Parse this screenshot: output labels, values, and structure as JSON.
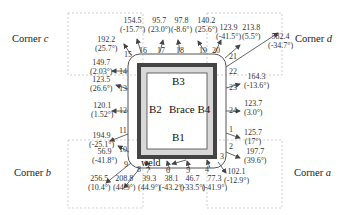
{
  "corners": {
    "a": {
      "prefix": "Corner ",
      "letter": "a"
    },
    "b": {
      "prefix": "Corner ",
      "letter": "b"
    },
    "c": {
      "prefix": "Corner ",
      "letter": "c"
    },
    "d": {
      "prefix": "Corner ",
      "letter": "d"
    }
  },
  "plates": {
    "b1": "B1",
    "b2": "B2",
    "b3": "B3",
    "brace": "Brace B4"
  },
  "weld_label": "weld",
  "points": [
    {
      "id": "1",
      "value": "125.7",
      "angle": "(17°)"
    },
    {
      "id": "2",
      "value": "197.7",
      "angle": "(39.6°)"
    },
    {
      "id": "3",
      "value": "102.1",
      "angle": "(-12.9°)"
    },
    {
      "id": "4",
      "value": "77.3",
      "angle": "(-41.9°)"
    },
    {
      "id": "5",
      "value": "46.7",
      "angle": "(-33.5°)"
    },
    {
      "id": "6",
      "value": "38.1",
      "angle": "(-43.2°)"
    },
    {
      "id": "7",
      "value": "39.3",
      "angle": "(44.9°)"
    },
    {
      "id": "8",
      "value": "208.8",
      "angle": "(44.9°)"
    },
    {
      "id": "9",
      "value": "256.5",
      "angle": "(10.4°)"
    },
    {
      "id": "10",
      "value": "56.9",
      "angle": "(-41.8°)"
    },
    {
      "id": "11",
      "value": "194.9",
      "angle": "(-25.1°)"
    },
    {
      "id": "12",
      "value": "120.1",
      "angle": "(1.52°)"
    },
    {
      "id": "13",
      "value": "123.5",
      "angle": "(26.6°)"
    },
    {
      "id": "14",
      "value": "149.7",
      "angle": "(2.03°)"
    },
    {
      "id": "15",
      "value": "192.2",
      "angle": "(25.7°)"
    },
    {
      "id": "16",
      "value": "154.5",
      "angle": "(-15.7°)"
    },
    {
      "id": "17",
      "value": "95.7",
      "angle": "(23.0°)"
    },
    {
      "id": "18",
      "value": "97.8",
      "angle": "(-8.6°)"
    },
    {
      "id": "19",
      "value": "140.2",
      "angle": "(25.6°)"
    },
    {
      "id": "20",
      "value": "123.9",
      "angle": "(-41.5°)"
    },
    {
      "id": "21",
      "value": "213.8",
      "angle": "(5.5°)"
    },
    {
      "id": "22",
      "value": "582.4",
      "angle": "(-34.7°)"
    },
    {
      "id": "23",
      "value": "164.3",
      "angle": "(-13.6°)"
    },
    {
      "id": "24",
      "value": "123.7",
      "angle": "(3.0°)"
    }
  ]
}
